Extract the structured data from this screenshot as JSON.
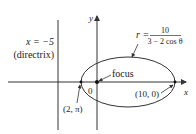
{
  "diagram": {
    "type": "polar conic (ellipse)",
    "equation": {
      "lhs": "r =",
      "numerator": "10",
      "denominator": "3 − 2 cos θ"
    },
    "directrix": {
      "equation": "x = −5",
      "label": "(directrix)"
    },
    "axes": {
      "x_label": "x",
      "y_label": "y",
      "origin_label": "0"
    },
    "focus_label": "focus",
    "points": [
      {
        "label": "(10, 0)",
        "role": "right vertex"
      },
      {
        "label": "(2, π)",
        "role": "left vertex"
      }
    ],
    "colors": {
      "line": "#333333",
      "text": "#222222",
      "background": "#ffffff"
    }
  }
}
